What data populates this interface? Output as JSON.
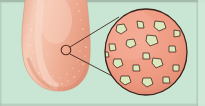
{
  "figure": {
    "inset_subject": "papillae",
    "background_color": "#c9e6d4",
    "border_color": "#8c9c92",
    "caption": ""
  },
  "tongue": {
    "name": "tongue-tip",
    "fill_color": "#f0b49b",
    "shade_color": "#e59d85",
    "highlight_color": "#f8d6c6",
    "outline_color": "#d99d86",
    "speckle_color": "#fbe6da"
  },
  "marker": {
    "name": "magnification-marker",
    "label": "",
    "cx": 66,
    "cy": 50,
    "r": 5,
    "stroke_color": "#5a2d22"
  },
  "leader_lines": {
    "name": "leader-lines",
    "stroke_color": "#3a2018",
    "upper": {
      "x1": 70,
      "y1": 47,
      "x2": 119,
      "y2": 17
    },
    "lower": {
      "x1": 70,
      "y1": 54,
      "x2": 116,
      "y2": 78
    }
  },
  "inset": {
    "name": "magnified-circle",
    "label": "",
    "cx": 146,
    "cy": 52,
    "rx": 41,
    "ry": 43,
    "fill_color": "#f09b84",
    "stroke_color": "#3a2018",
    "papilla_fill": "#dbe8bd",
    "papilla_stroke": "#3a2018",
    "papillae_count": 17,
    "papillae": [
      {
        "cx": 122,
        "cy": 29,
        "r": 5.2,
        "rot": 18,
        "sides": 5
      },
      {
        "cx": 140,
        "cy": 24,
        "r": 4.0,
        "rot": -25,
        "sides": 4
      },
      {
        "cx": 160,
        "cy": 25,
        "r": 5.6,
        "rot": 10,
        "sides": 5
      },
      {
        "cx": 177,
        "cy": 33,
        "r": 4.2,
        "rot": 40,
        "sides": 4
      },
      {
        "cx": 112,
        "cy": 47,
        "r": 4.4,
        "rot": -10,
        "sides": 4
      },
      {
        "cx": 131,
        "cy": 43,
        "r": 5.0,
        "rot": 28,
        "sides": 5
      },
      {
        "cx": 152,
        "cy": 40,
        "r": 5.8,
        "rot": -15,
        "sides": 5
      },
      {
        "cx": 172,
        "cy": 49,
        "r": 4.6,
        "rot": 35,
        "sides": 4
      },
      {
        "cx": 146,
        "cy": 56,
        "r": 4.2,
        "rot": 5,
        "sides": 4
      },
      {
        "cx": 118,
        "cy": 63,
        "r": 4.8,
        "rot": -30,
        "sides": 5
      },
      {
        "cx": 136,
        "cy": 68,
        "r": 4.4,
        "rot": 22,
        "sides": 4
      },
      {
        "cx": 158,
        "cy": 63,
        "r": 5.2,
        "rot": -8,
        "sides": 5
      },
      {
        "cx": 176,
        "cy": 68,
        "r": 4.0,
        "rot": 45,
        "sides": 4
      },
      {
        "cx": 126,
        "cy": 80,
        "r": 5.0,
        "rot": 12,
        "sides": 5
      },
      {
        "cx": 148,
        "cy": 82,
        "r": 5.4,
        "rot": -20,
        "sides": 5
      },
      {
        "cx": 166,
        "cy": 80,
        "r": 4.2,
        "rot": 30,
        "sides": 4
      },
      {
        "cx": 106,
        "cy": 55,
        "r": 3.6,
        "rot": 0,
        "sides": 4
      }
    ]
  }
}
